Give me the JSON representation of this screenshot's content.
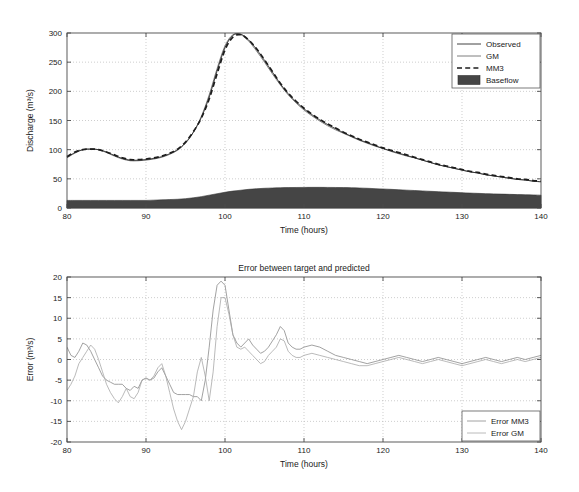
{
  "figure": {
    "background": "#ffffff",
    "width": 579,
    "height": 492
  },
  "chart_data": [
    {
      "type": "line",
      "id": "hydrograph",
      "title": "",
      "xlabel": "Time (hours)",
      "ylabel": "Discharge (m³/s)",
      "xlim": [
        80,
        140
      ],
      "ylim": [
        0,
        300
      ],
      "xticks": [
        80,
        90,
        100,
        110,
        120,
        130,
        140
      ],
      "yticks": [
        0,
        50,
        100,
        150,
        200,
        250,
        300
      ],
      "grid": true,
      "legend_position": "top-right",
      "legend": [
        "Observed",
        "GM",
        "MM3",
        "Baseflow"
      ],
      "x": [
        80,
        81,
        82,
        83,
        84,
        85,
        86,
        87,
        88,
        89,
        90,
        91,
        92,
        93,
        94,
        95,
        96,
        97,
        98,
        99,
        100,
        101,
        102,
        103,
        104,
        105,
        106,
        107,
        108,
        109,
        110,
        111,
        112,
        113,
        114,
        115,
        116,
        117,
        118,
        119,
        120,
        121,
        122,
        123,
        124,
        125,
        126,
        127,
        128,
        129,
        130,
        131,
        132,
        133,
        134,
        135,
        136,
        137,
        138,
        139,
        140
      ],
      "series": [
        {
          "name": "Observed",
          "style": "solid-thin-dark",
          "values": [
            87,
            95,
            100,
            101,
            100,
            96,
            90,
            85,
            82,
            82,
            83,
            85,
            88,
            93,
            100,
            112,
            130,
            155,
            190,
            235,
            275,
            296,
            298,
            288,
            272,
            253,
            233,
            213,
            196,
            182,
            170,
            160,
            151,
            143,
            136,
            129,
            123,
            117,
            112,
            107,
            102,
            98,
            94,
            90,
            86,
            82,
            78,
            74,
            71,
            68,
            65,
            62,
            60,
            57,
            55,
            53,
            51,
            49,
            48,
            46,
            45
          ]
        },
        {
          "name": "GM",
          "style": "solid-thin-gray",
          "values": [
            86,
            94,
            100,
            101,
            100,
            95,
            89,
            84,
            81,
            81,
            82,
            84,
            87,
            92,
            99,
            111,
            130,
            157,
            194,
            239,
            278,
            297,
            297,
            286,
            269,
            250,
            230,
            211,
            194,
            180,
            168,
            158,
            149,
            141,
            134,
            128,
            122,
            116,
            111,
            106,
            102,
            97,
            93,
            89,
            86,
            82,
            78,
            74,
            71,
            68,
            65,
            62,
            60,
            57,
            55,
            53,
            51,
            49,
            48,
            46,
            45
          ]
        },
        {
          "name": "MM3",
          "style": "dashed-thick-dark",
          "values": [
            88,
            96,
            100,
            101,
            100,
            96,
            91,
            86,
            83,
            83,
            84,
            86,
            89,
            94,
            101,
            113,
            131,
            154,
            187,
            230,
            271,
            293,
            297,
            288,
            273,
            254,
            234,
            214,
            197,
            183,
            171,
            161,
            152,
            144,
            137,
            130,
            124,
            118,
            113,
            108,
            103,
            99,
            95,
            91,
            87,
            83,
            79,
            75,
            72,
            69,
            66,
            63,
            61,
            58,
            56,
            54,
            52,
            50,
            49,
            47,
            46
          ]
        },
        {
          "name": "Baseflow",
          "style": "filled-area-dark",
          "values": [
            13,
            13,
            13,
            13,
            13,
            13,
            13,
            13,
            13,
            13,
            13,
            13.5,
            14,
            14.5,
            15,
            16,
            17.5,
            19.5,
            22,
            24.5,
            27,
            29,
            30.5,
            32,
            33,
            33.8,
            34.3,
            34.7,
            35,
            35.2,
            35.3,
            35.4,
            35.4,
            35.3,
            35.2,
            35,
            34.7,
            34.3,
            33.8,
            33.2,
            32.6,
            32,
            31.3,
            30.6,
            30,
            29.3,
            28.6,
            28,
            27.4,
            26.8,
            26.2,
            25.6,
            25.1,
            24.6,
            24.2,
            23.8,
            23.4,
            23,
            22.7,
            22.4,
            22
          ]
        }
      ]
    },
    {
      "type": "line",
      "id": "error-plot",
      "title": "Error between target and predicted",
      "xlabel": "Time (hours)",
      "ylabel": "Error (m³/s)",
      "xlim": [
        80,
        140
      ],
      "ylim": [
        -20,
        20
      ],
      "xticks": [
        80,
        90,
        100,
        110,
        120,
        130,
        140
      ],
      "yticks": [
        -20,
        -15,
        -10,
        -5,
        0,
        5,
        10,
        15,
        20
      ],
      "grid": true,
      "legend_position": "bottom-right",
      "legend": [
        "Error MM3",
        "Error GM"
      ],
      "x": [
        80,
        80.5,
        81,
        81.5,
        82,
        82.5,
        83,
        83.5,
        84,
        84.5,
        85,
        85.5,
        86,
        86.5,
        87,
        87.5,
        88,
        88.5,
        89,
        89.5,
        90,
        90.5,
        91,
        91.5,
        92,
        92.5,
        93,
        93.5,
        94,
        94.5,
        95,
        95.5,
        96,
        96.5,
        97,
        97.5,
        98,
        98.5,
        99,
        99.5,
        100,
        100.5,
        101,
        101.5,
        102,
        102.5,
        103,
        103.5,
        104,
        104.5,
        105,
        105.5,
        106,
        106.5,
        107,
        107.5,
        108,
        108.5,
        109,
        109.5,
        110,
        111,
        112,
        113,
        114,
        115,
        116,
        117,
        118,
        119,
        120,
        121,
        122,
        123,
        124,
        125,
        126,
        127,
        128,
        129,
        130,
        131,
        132,
        133,
        134,
        135,
        136,
        137,
        138,
        139,
        140
      ],
      "series": [
        {
          "name": "Error MM3",
          "style": "solid-thin-gray",
          "values": [
            3,
            1,
            0.5,
            2,
            4,
            3.5,
            2,
            0,
            -2,
            -4,
            -5,
            -5.5,
            -6,
            -6,
            -6,
            -7,
            -7.5,
            -6.5,
            -7,
            -5,
            -4.5,
            -5,
            -4.5,
            -3,
            -2,
            -4,
            -6,
            -8,
            -8.5,
            -8.5,
            -8.5,
            -8.5,
            -9,
            -9,
            -10,
            -5,
            3,
            12,
            18,
            19,
            18,
            12,
            6,
            4,
            3,
            4,
            5,
            3.5,
            2.5,
            1.5,
            2,
            3,
            4.5,
            6,
            8,
            7,
            4,
            3,
            2.5,
            2.5,
            3,
            3.5,
            3,
            2,
            1,
            0.5,
            0,
            -0.5,
            -1,
            -0.5,
            0,
            0.5,
            1,
            0.5,
            0,
            -0.5,
            0,
            0.5,
            0,
            -0.5,
            -1,
            -0.5,
            0,
            0.5,
            0,
            -0.5,
            0,
            0.5,
            0,
            0.5,
            1
          ]
        },
        {
          "name": "Error GM",
          "style": "solid-thin-lightgray",
          "values": [
            -7.5,
            -6,
            -4,
            -1,
            0.5,
            2,
            3.5,
            2.5,
            0,
            -3,
            -6,
            -8,
            -9.5,
            -10.5,
            -9,
            -7,
            -9,
            -9.5,
            -8,
            -5,
            -4.5,
            -5,
            -4,
            -2,
            -1,
            -4,
            -8,
            -12,
            -15,
            -17,
            -15,
            -12,
            -9,
            -3,
            0.5,
            -4,
            -10,
            -3,
            8,
            15,
            15,
            11,
            6,
            3,
            2.5,
            3,
            2,
            1,
            0,
            -1,
            -0.5,
            1,
            2,
            3,
            5,
            4.5,
            2,
            1,
            0.5,
            0.5,
            1,
            1.5,
            1,
            0.5,
            0,
            -0.5,
            -1,
            -1.5,
            -1.5,
            -1,
            -0.5,
            0,
            0.5,
            0,
            -0.5,
            -1,
            -0.5,
            0,
            -0.5,
            -1,
            -1.5,
            -1,
            -0.5,
            0,
            -0.5,
            -1,
            -0.5,
            0,
            -0.5,
            0,
            0.5
          ]
        }
      ]
    }
  ]
}
